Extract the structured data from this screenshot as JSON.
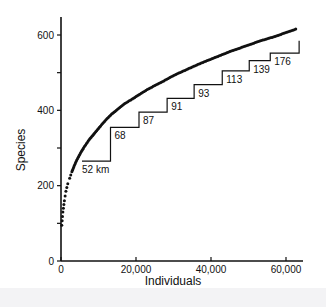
{
  "chart_data": {
    "type": "scatter",
    "title": "",
    "xlabel": "Individuals",
    "ylabel": "Species",
    "xlim": [
      0,
      65000
    ],
    "ylim": [
      0,
      650
    ],
    "x_ticks": [
      0,
      20000,
      40000,
      60000
    ],
    "x_tick_labels": [
      "0",
      "20,000",
      "40,000",
      "60,000"
    ],
    "y_ticks": [
      0,
      100,
      200,
      300,
      400,
      500,
      600
    ],
    "y_tick_labels": [
      "0",
      "",
      "200",
      "",
      "400",
      "",
      "600"
    ],
    "grid": false,
    "legend": null,
    "series": [
      {
        "name": "Species accumulation curve",
        "style": "dotted-curve",
        "points": [
          [
            200,
            95
          ],
          [
            500,
            130
          ],
          [
            900,
            160
          ],
          [
            1300,
            185
          ],
          [
            1800,
            205
          ],
          [
            2300,
            220
          ],
          [
            2900,
            237
          ],
          [
            3500,
            252
          ],
          [
            4200,
            268
          ],
          [
            5000,
            283
          ],
          [
            6000,
            300
          ],
          [
            7500,
            322
          ],
          [
            9000,
            340
          ],
          [
            10500,
            358
          ],
          [
            12000,
            375
          ],
          [
            13500,
            390
          ],
          [
            15000,
            402
          ],
          [
            17000,
            418
          ],
          [
            19000,
            430
          ],
          [
            21000,
            443
          ],
          [
            23000,
            455
          ],
          [
            25000,
            466
          ],
          [
            27000,
            476
          ],
          [
            29000,
            487
          ],
          [
            31000,
            497
          ],
          [
            33000,
            506
          ],
          [
            35000,
            515
          ],
          [
            37000,
            524
          ],
          [
            39000,
            532
          ],
          [
            41000,
            540
          ],
          [
            43000,
            548
          ],
          [
            45000,
            556
          ],
          [
            47000,
            563
          ],
          [
            49000,
            570
          ],
          [
            51000,
            577
          ],
          [
            53000,
            584
          ],
          [
            55000,
            590
          ],
          [
            57000,
            596
          ],
          [
            59000,
            603
          ],
          [
            61000,
            610
          ],
          [
            63000,
            617
          ]
        ]
      },
      {
        "name": "Cumulative area steps",
        "style": "step-line",
        "steps": [
          {
            "label": "52 km",
            "x_start": 5600,
            "x_end": 13200,
            "y": 265
          },
          {
            "label": "68",
            "x_start": 13200,
            "x_end": 20800,
            "y": 355
          },
          {
            "label": "87",
            "x_start": 20800,
            "x_end": 28300,
            "y": 395
          },
          {
            "label": "91",
            "x_start": 28300,
            "x_end": 35500,
            "y": 432
          },
          {
            "label": "93",
            "x_start": 35500,
            "x_end": 43000,
            "y": 468
          },
          {
            "label": "113",
            "x_start": 43000,
            "x_end": 50200,
            "y": 505
          },
          {
            "label": "139",
            "x_start": 50200,
            "x_end": 55800,
            "y": 532
          },
          {
            "label": "176",
            "x_start": 55800,
            "x_end": 63500,
            "y": 552
          }
        ],
        "final_rise": {
          "x": 63500,
          "y_from": 552,
          "y_to": 585
        }
      }
    ]
  }
}
